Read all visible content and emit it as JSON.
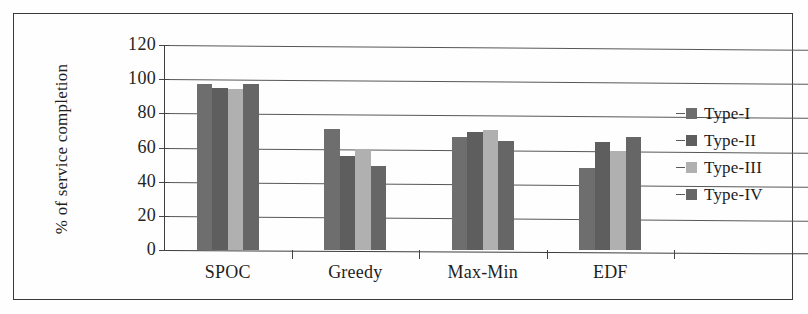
{
  "chart_data": {
    "type": "bar",
    "title": "",
    "xlabel": "",
    "ylabel": "% of service completion",
    "ylim": [
      0,
      120
    ],
    "yticks": [
      0,
      20,
      40,
      60,
      80,
      100,
      120
    ],
    "grid": true,
    "legend_position": "right",
    "categories": [
      "SPOC",
      "Greedy",
      "Max-Min",
      "EDF"
    ],
    "series": [
      {
        "name": "Type-I",
        "color": "#6e6e6e",
        "values": [
          97,
          71,
          66,
          48
        ]
      },
      {
        "name": "Type-II",
        "color": "#5e5e5e",
        "values": [
          95,
          55,
          69,
          63
        ]
      },
      {
        "name": "Type-III",
        "color": "#b0b0b0",
        "values": [
          94,
          59,
          70,
          58
        ]
      },
      {
        "name": "Type-IV",
        "color": "#666666",
        "values": [
          97,
          49,
          64,
          66
        ]
      }
    ]
  },
  "axis": {
    "y_tick_labels": [
      "120",
      "100",
      "80",
      "60",
      "40",
      "20",
      "0"
    ]
  },
  "colors": {
    "frame": "#3a3a3a",
    "gridline": "#585858",
    "axis": "#3d3d3d",
    "text": "#1f1f1f",
    "background": "#fefefe"
  }
}
